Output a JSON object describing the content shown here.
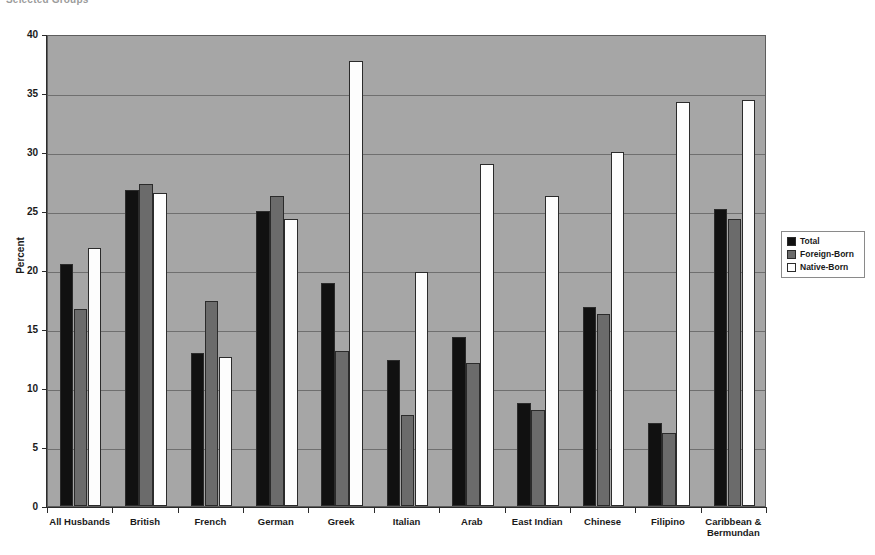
{
  "caption": "Selected Groups",
  "chart_data": {
    "type": "bar",
    "title": "",
    "xlabel": "",
    "ylabel": "Percent",
    "ylim": [
      0,
      40
    ],
    "yticks": [
      0,
      5,
      10,
      15,
      20,
      25,
      30,
      35,
      40
    ],
    "grid": true,
    "legend_position": "right",
    "categories": [
      "All Husbands",
      "British",
      "French",
      "German",
      "Greek",
      "Italian",
      "Arab",
      "East Indian",
      "Chinese",
      "Filipino",
      "Caribbean & Bermundan"
    ],
    "series": [
      {
        "name": "Total",
        "color": "#111111",
        "values": [
          20.5,
          26.8,
          13.0,
          25.0,
          18.9,
          12.4,
          14.3,
          8.7,
          16.9,
          7.0,
          25.2
        ]
      },
      {
        "name": "Foreign-Born",
        "color": "#6b6b6b",
        "values": [
          16.7,
          27.3,
          17.4,
          26.3,
          13.1,
          7.7,
          12.1,
          8.1,
          16.3,
          6.2,
          24.3
        ]
      },
      {
        "name": "Native-Born",
        "color": "#ffffff",
        "values": [
          21.9,
          26.5,
          12.6,
          24.3,
          37.7,
          19.8,
          29.0,
          26.3,
          30.0,
          34.2,
          34.4
        ]
      }
    ]
  },
  "legend": {
    "items": [
      {
        "label": "Total",
        "swatch": "total"
      },
      {
        "label": "Foreign-Born",
        "swatch": "foreign"
      },
      {
        "label": "Native-Born",
        "swatch": "native"
      }
    ]
  }
}
